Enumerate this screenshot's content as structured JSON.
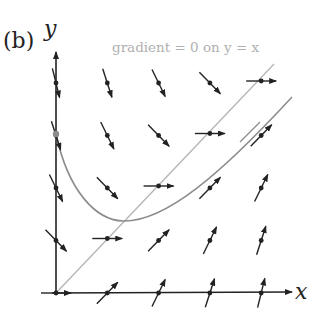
{
  "figure": {
    "panel_label": "(b)",
    "x_axis_label": "x",
    "y_axis_label": "y",
    "annotation": "gradient = 0 on y = x",
    "colors": {
      "axes": "#222222",
      "arrows": "#222222",
      "isocline": "#b4b4b4",
      "solution_curve": "#8c8c8c",
      "annotation_text": "#b0b0b0",
      "initial_point": "#8c8c8c"
    }
  },
  "chart_data": {
    "type": "direction-field",
    "title": "gradient = 0 on y = x",
    "xlabel": "x",
    "ylabel": "y",
    "equation_hint": "dy/dx = 0 along y = x",
    "grid_x": [
      0,
      1,
      2,
      3,
      4
    ],
    "grid_y": [
      0,
      1,
      2,
      3,
      4
    ],
    "isocline": "y = x",
    "solution_curve_start": [
      0,
      3
    ],
    "solution_curve_min": [
      1.3,
      1.4
    ]
  }
}
